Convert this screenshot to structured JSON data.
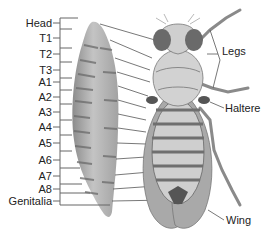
{
  "diagram": {
    "segment_labels": [
      {
        "id": "head",
        "text": "Head"
      },
      {
        "id": "t1",
        "text": "T1"
      },
      {
        "id": "t2",
        "text": "T2"
      },
      {
        "id": "t3",
        "text": "T3"
      },
      {
        "id": "a1",
        "text": "A1"
      },
      {
        "id": "a2",
        "text": "A2"
      },
      {
        "id": "a3",
        "text": "A3"
      },
      {
        "id": "a4",
        "text": "A4"
      },
      {
        "id": "a5",
        "text": "A5"
      },
      {
        "id": "a6",
        "text": "A6"
      },
      {
        "id": "a7",
        "text": "A7"
      },
      {
        "id": "a8",
        "text": "A8"
      },
      {
        "id": "genitalia",
        "text": "Genitalia"
      }
    ],
    "structure_labels": {
      "legs": "Legs",
      "haltere": "Haltere",
      "wing": "Wing"
    },
    "colors": {
      "larva": "#b8b8b8",
      "larva_stripes": "#6e6e6e",
      "fly_body": "#c9c9c9",
      "wing": "#a8a8a8",
      "abdomen_bands": "#707070",
      "eyes": "#6a6a6a",
      "leader_lines": "#555555"
    }
  }
}
